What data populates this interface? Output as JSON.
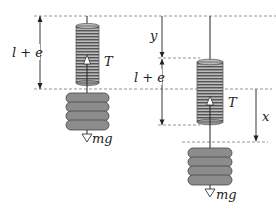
{
  "figure": {
    "colors": {
      "line": "#222222",
      "dash": "#7a7a7a",
      "spring_fill": "#8a8a8a",
      "spring_stripe": "#e8e8e8",
      "weight_fill": "#8c8c8c",
      "weight_stroke": "#444444"
    },
    "left": {
      "length_label": "l + e",
      "tension_label": "T",
      "weight_label": "mg"
    },
    "right": {
      "displacement_top_label": "y",
      "length_label": "l + e",
      "tension_label": "T",
      "displacement_label": "x",
      "weight_label": "mg"
    }
  }
}
